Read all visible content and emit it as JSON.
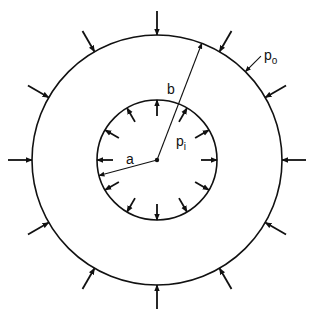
{
  "diagram": {
    "center": {
      "x": 157,
      "y": 160
    },
    "inner_radius": 60,
    "outer_radius": 125,
    "stroke_color": "#111111",
    "background": "#ffffff",
    "inner_arrow_angles_deg": [
      0,
      30,
      60,
      90,
      120,
      150,
      180,
      210,
      240,
      270,
      300,
      330
    ],
    "outer_arrow_angles_deg": [
      0,
      30,
      60,
      90,
      120,
      150,
      180,
      210,
      240,
      270,
      300,
      330
    ],
    "radius_a_angle_deg": 195,
    "radius_b_angle_deg": 69,
    "leader_po_angle_deg": 45
  },
  "labels": {
    "a": "a",
    "b": "b",
    "p_i_base": "p",
    "p_i_sub": "i",
    "p_o_base": "p",
    "p_o_sub": "o"
  }
}
